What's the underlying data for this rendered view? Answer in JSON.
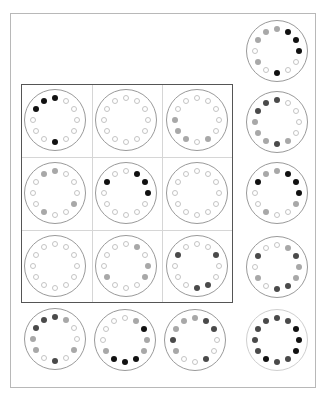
{
  "puzzle": {
    "description": "Rotating dial pattern puzzle: 3x3 grid of dials with row and column result dials",
    "ring_positions": 12,
    "colors": {
      "empty": "#ffffff",
      "gray": "#a8a8a8",
      "dark": "#4a4a4a",
      "black": "#111111",
      "outline": "#9a9a9a",
      "grid_border": "#555555",
      "frame_border": "#b8b8b8"
    },
    "legend": {
      "e": "empty",
      "g": "gray",
      "d": "dark",
      "b": "black"
    }
  },
  "grid": [
    {
      "id": "r1c1",
      "row": 1,
      "col": 1,
      "x": 24,
      "y": 89,
      "dots": [
        "b",
        "e",
        "e",
        "e",
        "e",
        "e",
        "b",
        "e",
        "e",
        "e",
        "b",
        "b"
      ]
    },
    {
      "id": "r1c2",
      "row": 1,
      "col": 2,
      "x": 95,
      "y": 89,
      "dots": [
        "e",
        "e",
        "e",
        "e",
        "e",
        "e",
        "e",
        "e",
        "e",
        "e",
        "e",
        "e"
      ]
    },
    {
      "id": "r1c3",
      "row": 1,
      "col": 3,
      "x": 166,
      "y": 89,
      "dots": [
        "e",
        "e",
        "e",
        "e",
        "e",
        "g",
        "e",
        "g",
        "g",
        "g",
        "e",
        "e"
      ]
    },
    {
      "id": "r2c1",
      "row": 2,
      "col": 1,
      "x": 24,
      "y": 162,
      "dots": [
        "g",
        "e",
        "e",
        "e",
        "g",
        "e",
        "e",
        "g",
        "e",
        "e",
        "e",
        "g"
      ]
    },
    {
      "id": "r2c2",
      "row": 2,
      "col": 2,
      "x": 95,
      "y": 162,
      "dots": [
        "e",
        "b",
        "b",
        "b",
        "e",
        "e",
        "e",
        "e",
        "e",
        "e",
        "b",
        "e"
      ]
    },
    {
      "id": "r2c3",
      "row": 2,
      "col": 3,
      "x": 166,
      "y": 162,
      "dots": [
        "e",
        "e",
        "e",
        "e",
        "e",
        "e",
        "e",
        "e",
        "e",
        "e",
        "e",
        "e"
      ]
    },
    {
      "id": "r3c1",
      "row": 3,
      "col": 1,
      "x": 24,
      "y": 235,
      "dots": [
        "e",
        "e",
        "e",
        "e",
        "e",
        "e",
        "e",
        "e",
        "e",
        "e",
        "e",
        "e"
      ]
    },
    {
      "id": "r3c2",
      "row": 3,
      "col": 2,
      "x": 95,
      "y": 235,
      "dots": [
        "e",
        "g",
        "e",
        "g",
        "g",
        "e",
        "e",
        "e",
        "g",
        "e",
        "e",
        "e"
      ]
    },
    {
      "id": "r3c3",
      "row": 3,
      "col": 3,
      "x": 166,
      "y": 235,
      "dots": [
        "e",
        "e",
        "d",
        "e",
        "e",
        "d",
        "d",
        "e",
        "e",
        "e",
        "d",
        "e"
      ]
    }
  ],
  "right_column": [
    {
      "id": "right-1",
      "x": 246,
      "y": 20,
      "dots": [
        "g",
        "b",
        "b",
        "b",
        "e",
        "e",
        "b",
        "e",
        "g",
        "e",
        "g",
        "g"
      ]
    },
    {
      "id": "right-2",
      "x": 246,
      "y": 91,
      "dots": [
        "d",
        "e",
        "e",
        "e",
        "e",
        "g",
        "d",
        "g",
        "g",
        "g",
        "d",
        "d"
      ]
    },
    {
      "id": "right-3",
      "x": 246,
      "y": 162,
      "dots": [
        "g",
        "b",
        "b",
        "b",
        "g",
        "e",
        "e",
        "g",
        "e",
        "e",
        "b",
        "g"
      ]
    },
    {
      "id": "right-4",
      "x": 246,
      "y": 236,
      "dots": [
        "e",
        "g",
        "d",
        "g",
        "g",
        "d",
        "d",
        "e",
        "g",
        "e",
        "d",
        "e"
      ]
    },
    {
      "id": "right-5",
      "x": 246,
      "y": 309,
      "light": true,
      "dots": [
        "d",
        "d",
        "b",
        "b",
        "b",
        "d",
        "d",
        "b",
        "d",
        "d",
        "d",
        "d"
      ]
    }
  ],
  "bottom_row": [
    {
      "id": "bottom-1",
      "x": 24,
      "y": 308,
      "dots": [
        "d",
        "g",
        "e",
        "e",
        "g",
        "e",
        "d",
        "e",
        "g",
        "g",
        "d",
        "d"
      ]
    },
    {
      "id": "bottom-2",
      "x": 94,
      "y": 309,
      "dots": [
        "e",
        "g",
        "b",
        "g",
        "g",
        "b",
        "b",
        "b",
        "g",
        "e",
        "e",
        "e"
      ]
    },
    {
      "id": "bottom-3",
      "x": 164,
      "y": 309,
      "dots": [
        "g",
        "d",
        "d",
        "e",
        "e",
        "d",
        "e",
        "e",
        "g",
        "d",
        "g",
        "g"
      ]
    }
  ]
}
